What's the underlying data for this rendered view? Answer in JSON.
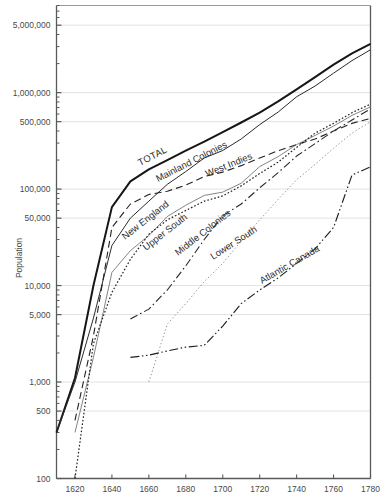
{
  "figure": {
    "title": "",
    "ylabel": "Population",
    "xlabel": ""
  },
  "axis": {
    "x_ticks": [
      "1620",
      "1640",
      "1660",
      "1680",
      "1700",
      "1720",
      "1740",
      "1760",
      "1780"
    ],
    "y_ticks": [
      "100",
      "500",
      "1,000",
      "5,000",
      "10,000",
      "50,000",
      "100,000",
      "500,000",
      "1,000,000",
      "5,000,000"
    ]
  },
  "series_labels": {
    "total": "TOTAL",
    "mainland": "Mainland Colonies",
    "west_indies": "West Indies",
    "new_england": "New England",
    "upper_south": "Upper South",
    "middle_colonies": "Middle Colonies",
    "lower_south": "Lower South",
    "atlantic_canada": "Atlantic Canada"
  },
  "chart_data": {
    "type": "line",
    "title": "",
    "xlabel": "",
    "ylabel": "Population",
    "xlim": [
      1610,
      1780
    ],
    "ylim": [
      100,
      8000000
    ],
    "yscale": "log",
    "grid": "horizontal",
    "legend": "inline-labels",
    "xticks": [
      1620,
      1640,
      1660,
      1680,
      1700,
      1720,
      1740,
      1760,
      1780
    ],
    "yticks": [
      100,
      500,
      1000,
      5000,
      10000,
      50000,
      100000,
      500000,
      1000000,
      5000000
    ],
    "series": [
      {
        "name": "TOTAL",
        "style": "solid-thick",
        "x": [
          1610,
          1620,
          1630,
          1640,
          1650,
          1660,
          1670,
          1680,
          1690,
          1700,
          1710,
          1720,
          1730,
          1740,
          1750,
          1760,
          1770,
          1780
        ],
        "values": [
          300,
          1100,
          10000,
          65000,
          120000,
          160000,
          200000,
          250000,
          310000,
          390000,
          490000,
          620000,
          810000,
          1080000,
          1450000,
          1950000,
          2550000,
          3200000
        ]
      },
      {
        "name": "Mainland Colonies",
        "style": "solid-thin",
        "x": [
          1610,
          1620,
          1630,
          1640,
          1650,
          1660,
          1670,
          1680,
          1690,
          1700,
          1710,
          1720,
          1730,
          1740,
          1750,
          1760,
          1770,
          1780
        ],
        "values": [
          300,
          1000,
          4600,
          26000,
          50000,
          75000,
          112000,
          152000,
          210000,
          251000,
          331000,
          466000,
          629000,
          906000,
          1170000,
          1590000,
          2148000,
          2780000
        ]
      },
      {
        "name": "West Indies",
        "style": "dashed",
        "x": [
          1620,
          1630,
          1640,
          1650,
          1660,
          1670,
          1680,
          1690,
          1700,
          1710,
          1720,
          1730,
          1740,
          1750,
          1760,
          1770,
          1780
        ],
        "values": [
          400,
          3000,
          40000,
          70000,
          88000,
          95000,
          110000,
          135000,
          150000,
          175000,
          210000,
          250000,
          290000,
          330000,
          400000,
          480000,
          540000
        ]
      },
      {
        "name": "New England",
        "style": "solid-thin-light",
        "x": [
          1620,
          1630,
          1640,
          1650,
          1660,
          1670,
          1680,
          1690,
          1700,
          1710,
          1720,
          1730,
          1740,
          1750,
          1760,
          1770,
          1780
        ],
        "values": [
          300,
          1800,
          13700,
          23000,
          33000,
          52000,
          68000,
          86000,
          93000,
          115000,
          171000,
          217000,
          289000,
          360000,
          450000,
          581000,
          712000
        ]
      },
      {
        "name": "Upper South",
        "style": "dotted",
        "x": [
          1620,
          1630,
          1640,
          1650,
          1660,
          1670,
          1680,
          1690,
          1700,
          1710,
          1720,
          1730,
          1740,
          1750,
          1760,
          1770,
          1780
        ],
        "values": [
          100,
          2500,
          8500,
          18700,
          34000,
          48000,
          60000,
          75000,
          85000,
          108000,
          145000,
          190000,
          270000,
          380000,
          480000,
          620000,
          760000
        ]
      },
      {
        "name": "Middle Colonies",
        "style": "dash-dot",
        "x": [
          1650,
          1660,
          1670,
          1680,
          1690,
          1700,
          1710,
          1720,
          1730,
          1740,
          1750,
          1760,
          1770,
          1780
        ],
        "values": [
          4500,
          5700,
          9000,
          16000,
          30000,
          53000,
          70000,
          103000,
          148000,
          220000,
          296000,
          400000,
          520000,
          680000
        ]
      },
      {
        "name": "Lower South",
        "style": "dotted-light",
        "x": [
          1660,
          1670,
          1680,
          1690,
          1700,
          1710,
          1720,
          1730,
          1740,
          1750,
          1760,
          1770,
          1780
        ],
        "values": [
          1000,
          4000,
          6500,
          11000,
          17000,
          29000,
          48000,
          78000,
          125000,
          180000,
          265000,
          380000,
          500000
        ]
      },
      {
        "name": "Atlantic Canada",
        "style": "dash-dot-dot",
        "x": [
          1650,
          1660,
          1670,
          1680,
          1690,
          1700,
          1710,
          1720,
          1730,
          1740,
          1750,
          1760,
          1770,
          1780
        ],
        "values": [
          1800,
          1900,
          2100,
          2300,
          2400,
          3800,
          6500,
          9000,
          12000,
          17000,
          24000,
          40000,
          140000,
          170000
        ]
      }
    ]
  }
}
